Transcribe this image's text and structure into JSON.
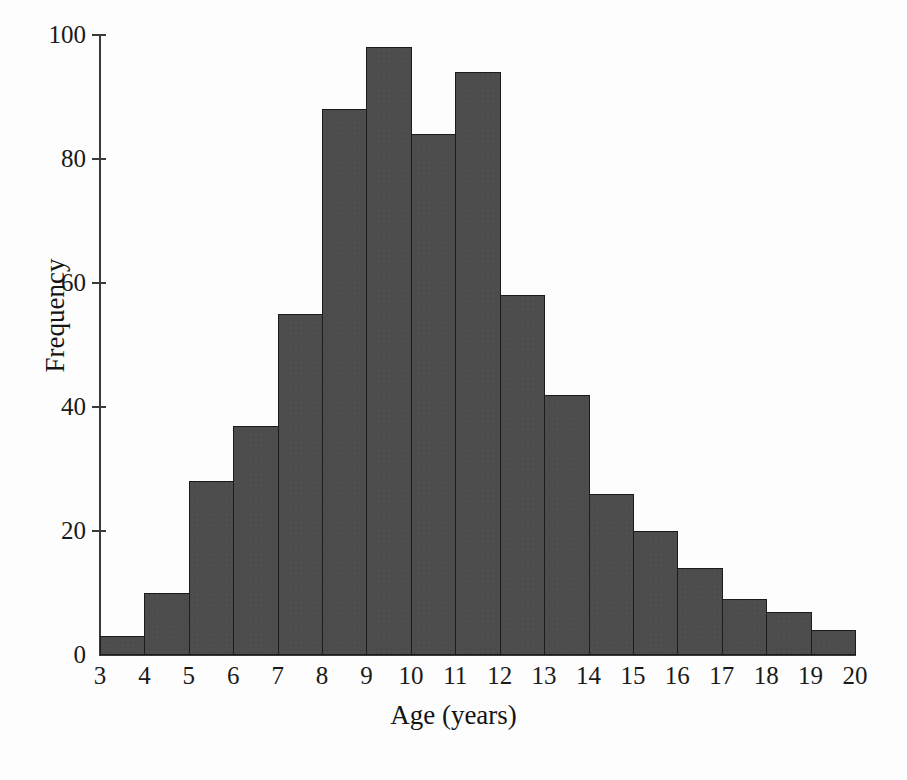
{
  "chart_data": {
    "type": "bar",
    "title": "",
    "xlabel": "Age (years)",
    "ylabel": "Frequency",
    "xlim": [
      3,
      20
    ],
    "ylim": [
      0,
      100
    ],
    "grid": false,
    "legend": null,
    "bin_width": 1,
    "bin_edges": [
      3,
      4,
      5,
      6,
      7,
      8,
      9,
      10,
      11,
      12,
      13,
      14,
      15,
      16,
      17,
      18,
      19,
      20
    ],
    "categories": [
      "3-4",
      "4-5",
      "5-6",
      "6-7",
      "7-8",
      "8-9",
      "9-10",
      "10-11",
      "11-12",
      "12-13",
      "13-14",
      "14-15",
      "15-16",
      "16-17",
      "17-18",
      "18-19",
      "19-20"
    ],
    "values": [
      3,
      10,
      28,
      37,
      55,
      88,
      98,
      84,
      94,
      58,
      42,
      26,
      20,
      14,
      9,
      7,
      4
    ],
    "x_tick_labels": [
      "3",
      "4",
      "5",
      "6",
      "7",
      "8",
      "9",
      "10",
      "11",
      "12",
      "13",
      "14",
      "15",
      "16",
      "17",
      "18",
      "19",
      "20"
    ],
    "y_tick_labels": [
      "0",
      "20",
      "40",
      "60",
      "80",
      "100"
    ],
    "y_ticks": [
      0,
      20,
      40,
      60,
      80,
      100
    ],
    "bar_color": "#4d4d4d",
    "bar_edge_color": "#1c1c1c",
    "axis_color": "#3a3a3a",
    "background_color": "#fdfdfd"
  }
}
